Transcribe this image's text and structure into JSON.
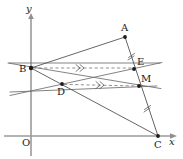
{
  "figure": {
    "kind": "geometry-diagram",
    "width": 183,
    "height": 159,
    "background": "#ffffff",
    "stroke_color": "#4a4a4a",
    "axis_color": "#9a9a9a",
    "dash_color": "#7d7d7d",
    "point_color": "#1c1c1c"
  },
  "axes": {
    "y_label": "y",
    "x_label": "x",
    "origin_label": "O",
    "x_axis": {
      "x1": 4,
      "y1": 136,
      "x2": 170,
      "y2": 136
    },
    "y_axis": {
      "x1": 31,
      "y1": 156,
      "x2": 31,
      "y2": 19
    }
  },
  "points": {
    "A": {
      "label": "A",
      "x": 125,
      "y": 37,
      "label_x": 121,
      "label_y": 23
    },
    "B": {
      "label": "B",
      "x": 31,
      "y": 68,
      "label_x": 19,
      "label_y": 69
    },
    "C": {
      "label": "C",
      "x": 158,
      "y": 136,
      "label_x": 155,
      "label_y": 142
    },
    "D": {
      "label": "D",
      "x": 62,
      "y": 84,
      "label_x": 58,
      "label_y": 88
    },
    "E": {
      "label": "E",
      "x": 134,
      "y": 69,
      "label_x": 137,
      "label_y": 60
    },
    "M": {
      "label": "M",
      "x": 139,
      "y": 86,
      "label_x": 141,
      "label_y": 76
    }
  },
  "segments": [
    {
      "name": "segment-BA",
      "from": "B",
      "to": "A",
      "style": "solid"
    },
    {
      "name": "segment-AC",
      "from": "A",
      "to": "C",
      "style": "solid"
    },
    {
      "name": "segment-BC",
      "from": "B",
      "to": "C",
      "style": "solid"
    },
    {
      "name": "segment-BE",
      "from": "B",
      "to": "E",
      "style": "dashed",
      "marker": "double-arrow"
    },
    {
      "name": "segment-DM",
      "from": "D",
      "to": "M",
      "style": "dashed",
      "marker": "double-arrow"
    }
  ],
  "lines": [
    {
      "name": "line-through-B-and-M",
      "note": "ray from lower-left through B toward M and beyond"
    },
    {
      "name": "line-through-D-and-E",
      "note": "ray from lower-left through D toward E and beyond"
    }
  ],
  "tick_marks": [
    {
      "name": "tick-on-AE",
      "x": 131,
      "y": 58
    },
    {
      "name": "tick-on-MC",
      "x": 147,
      "y": 110
    }
  ]
}
